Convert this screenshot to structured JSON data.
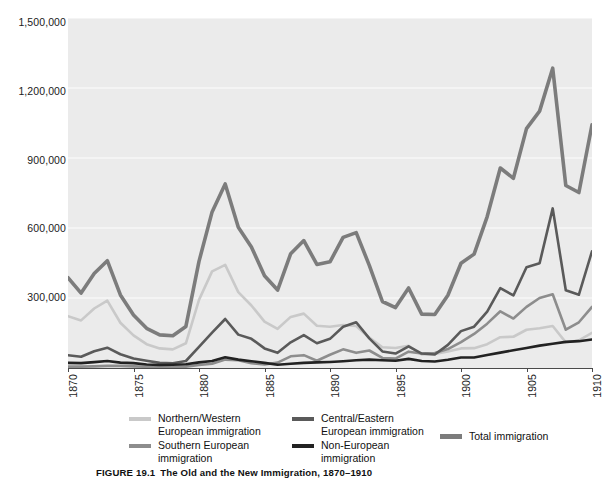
{
  "figure": {
    "caption_number": "FIGURE 19.1",
    "caption_title": "The Old and the New Immigration, 1870–1910"
  },
  "colors": {
    "plot_background": "#ebebeb",
    "gridline": "#f7f7f7",
    "axis": "#4a4a4a",
    "northern_western": "#c9c9c9",
    "southern": "#8d8d8d",
    "central_eastern": "#5a5a5a",
    "non_european": "#222222",
    "total": "#7c7c7c",
    "text": "#1b1b1b"
  },
  "axes": {
    "y_ticks": [
      "1,500,000",
      "1,200,000",
      "900,000",
      "600,000",
      "300,000"
    ],
    "y_tick_values": [
      1500000,
      1200000,
      900000,
      600000,
      300000
    ],
    "y_min": 0,
    "y_max": 1500000,
    "x_ticks": [
      "1870",
      "1875",
      "1880",
      "1885",
      "1890",
      "1895",
      "1900",
      "1905",
      "1910"
    ],
    "x_min": 1870,
    "x_max": 1910,
    "grid": true
  },
  "legend": {
    "position": "below-plot",
    "entries": [
      {
        "label": "Northern/Western\nEuropean immigration",
        "series": "northern_western",
        "color": "#c9c9c9"
      },
      {
        "label": "Central/Eastern\nEuropean immigration",
        "series": "central_eastern",
        "color": "#5a5a5a"
      },
      {
        "label": "Total immigration",
        "series": "total",
        "color": "#7c7c7c"
      },
      {
        "label": "Southern European\nimmigration",
        "series": "southern",
        "color": "#8d8d8d"
      },
      {
        "label": "Non-European\nimmigration",
        "series": "non_european",
        "color": "#222222"
      }
    ]
  },
  "chart_data": {
    "type": "line",
    "title": "The Old and the New Immigration, 1870–1910",
    "xlabel": "",
    "ylabel": "",
    "xlim": [
      1870,
      1910
    ],
    "ylim": [
      0,
      1500000
    ],
    "grid": true,
    "legend_position": "below",
    "x": [
      1870,
      1871,
      1872,
      1873,
      1874,
      1875,
      1876,
      1877,
      1878,
      1879,
      1880,
      1881,
      1882,
      1883,
      1884,
      1885,
      1886,
      1887,
      1888,
      1889,
      1890,
      1891,
      1892,
      1893,
      1894,
      1895,
      1896,
      1897,
      1898,
      1899,
      1900,
      1901,
      1902,
      1903,
      1904,
      1905,
      1906,
      1907,
      1908,
      1909,
      1910
    ],
    "series": [
      {
        "name": "Total immigration",
        "color": "#7c7c7c",
        "values": [
          387000,
          321000,
          405000,
          460000,
          313000,
          227000,
          170000,
          142000,
          138000,
          178000,
          457000,
          669000,
          789000,
          603000,
          519000,
          395000,
          334000,
          490000,
          546000,
          444000,
          455000,
          560000,
          580000,
          440000,
          285000,
          259000,
          343000,
          231000,
          229000,
          312000,
          449000,
          488000,
          649000,
          857000,
          813000,
          1026000,
          1101000,
          1285000,
          782000,
          752000,
          1042000
        ]
      },
      {
        "name": "Northern/Western European immigration",
        "color": "#c9c9c9",
        "values": [
          222000,
          204000,
          255000,
          289000,
          194000,
          140000,
          102000,
          84000,
          80000,
          106000,
          292000,
          414000,
          442000,
          325000,
          268000,
          199000,
          168000,
          219000,
          233000,
          181000,
          177000,
          184000,
          180000,
          130000,
          89000,
          86000,
          95000,
          58000,
          60000,
          71000,
          84000,
          85000,
          102000,
          132000,
          134000,
          164000,
          170000,
          180000,
          110000,
          118000,
          151000
        ]
      },
      {
        "name": "Southern European immigration",
        "color": "#8d8d8d",
        "values": [
          6000,
          6000,
          7000,
          9000,
          9000,
          7000,
          5000,
          4000,
          4000,
          6000,
          13000,
          18000,
          36000,
          33000,
          20000,
          15000,
          23000,
          50000,
          55000,
          31000,
          57000,
          80000,
          65000,
          75000,
          43000,
          40000,
          70000,
          62000,
          64000,
          81000,
          111000,
          146000,
          190000,
          243000,
          212000,
          262000,
          300000,
          316000,
          164000,
          196000,
          262000
        ]
      },
      {
        "name": "Central/Eastern European immigration",
        "color": "#5a5a5a",
        "values": [
          55000,
          48000,
          72000,
          87000,
          59000,
          41000,
          31000,
          22000,
          20000,
          30000,
          91000,
          152000,
          210000,
          143000,
          125000,
          84000,
          65000,
          110000,
          141000,
          106000,
          125000,
          177000,
          196000,
          127000,
          71000,
          62000,
          93000,
          62000,
          58000,
          99000,
          158000,
          177000,
          242000,
          342000,
          311000,
          432000,
          449000,
          684000,
          333000,
          314000,
          500000
        ]
      },
      {
        "name": "Non-European immigration",
        "color": "#222222",
        "values": [
          22000,
          21000,
          25000,
          30000,
          23000,
          21000,
          15000,
          13000,
          14000,
          16000,
          24000,
          30000,
          46000,
          36000,
          29000,
          22000,
          14000,
          18000,
          22000,
          24000,
          26000,
          29000,
          33000,
          36000,
          33000,
          31000,
          39000,
          30000,
          28000,
          35000,
          45000,
          45000,
          56000,
          66000,
          76000,
          86000,
          96000,
          104000,
          112000,
          115000,
          122000
        ]
      }
    ]
  }
}
